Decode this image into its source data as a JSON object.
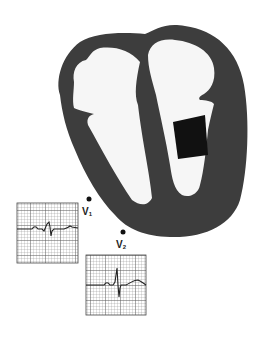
{
  "figure": {
    "colors": {
      "background": "#ffffff",
      "myocardium": "#3d3d3d",
      "chamber": "#f6f6f6",
      "lesion": "#111111",
      "electrode": "#111111",
      "ecg_grid": "#777777",
      "ecg_trace": "#222222"
    }
  },
  "leads": [
    {
      "id": "V1",
      "label_main": "V",
      "label_sub": "1",
      "electrode": {
        "x": 89,
        "y": 199
      },
      "ecg_box": {
        "x": 17,
        "y": 203,
        "w": 61,
        "h": 60
      },
      "waveform_description": "small r wave with deeper S wave (rS complex)"
    },
    {
      "id": "V2",
      "label_main": "V",
      "label_sub": "2",
      "electrode": {
        "x": 123,
        "y": 232
      },
      "ecg_box": {
        "x": 86,
        "y": 255,
        "w": 60,
        "h": 60
      },
      "waveform_description": "tall R spike with deep S and upright T wave"
    }
  ]
}
